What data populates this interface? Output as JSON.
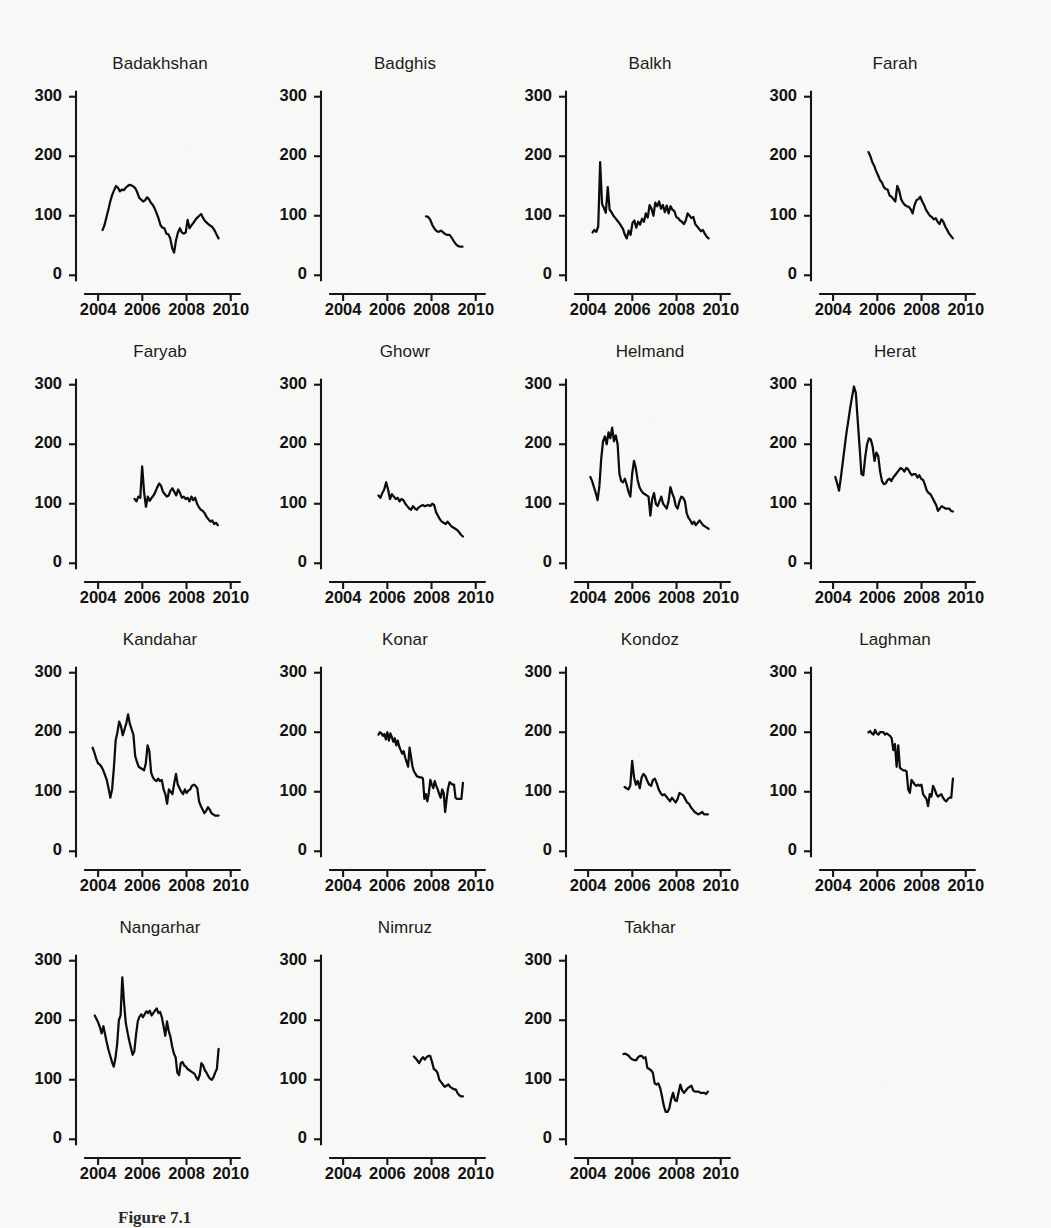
{
  "figure": {
    "caption": "Figure 7.1",
    "background_color": "#f8f8f6",
    "line_color": "#0c0c0c",
    "axis_color": "#151515",
    "columns": 4,
    "rows": 4
  },
  "chart_data": {
    "type": "line",
    "title": "",
    "subtitle": "",
    "xlabel": "",
    "ylabel": "",
    "xlim": [
      2003.0,
      2010.6
    ],
    "ylim": [
      -18,
      318
    ],
    "grid": false,
    "legend": "none",
    "panel_layout": "4 columns x 4 rows of small-multiple line panels; last row has 3 panels",
    "shared_x_ticks": [
      2004,
      2006,
      2008,
      2010
    ],
    "shared_x_tick_labels": [
      "2004",
      "2006",
      "2008",
      "2010"
    ],
    "shared_y_ticks": [
      0,
      100,
      200,
      300
    ],
    "shared_y_tick_labels": [
      "0",
      "100",
      "200",
      "300"
    ],
    "panels": [
      {
        "title": "Badakhshan",
        "x_start": 2004.2,
        "x_end": 2009.45,
        "values": [
          76,
          84,
          97,
          110,
          124,
          135,
          143,
          150,
          147,
          141,
          144,
          143,
          147,
          150,
          152,
          151,
          149,
          146,
          139,
          130,
          127,
          124,
          126,
          131,
          128,
          122,
          118,
          112,
          104,
          95,
          84,
          80,
          79,
          70,
          69,
          62,
          46,
          38,
          59,
          72,
          79,
          72,
          70,
          72,
          93,
          79,
          84,
          88,
          93,
          97,
          100,
          103,
          96,
          91,
          88,
          85,
          83,
          80,
          75,
          68,
          62
        ]
      },
      {
        "title": "Badghis",
        "x_start": 2007.75,
        "x_end": 2009.4,
        "values": [
          99,
          98,
          93,
          84,
          78,
          74,
          73,
          75,
          72,
          69,
          68,
          68,
          63,
          57,
          52,
          49,
          48,
          48
        ]
      },
      {
        "title": "Balkh",
        "x_start": 2004.2,
        "x_end": 2009.45,
        "values": [
          72,
          76,
          73,
          82,
          190,
          120,
          113,
          105,
          148,
          110,
          106,
          100,
          96,
          92,
          88,
          83,
          78,
          68,
          62,
          75,
          68,
          88,
          92,
          80,
          90,
          85,
          95,
          90,
          104,
          97,
          118,
          112,
          100,
          122,
          116,
          124,
          112,
          118,
          106,
          117,
          104,
          116,
          110,
          108,
          98,
          96,
          92,
          90,
          86,
          92,
          104,
          100,
          96,
          98,
          86,
          82,
          78,
          74,
          76,
          70,
          65,
          62
        ]
      },
      {
        "title": "Farah",
        "x_start": 2005.6,
        "x_end": 2009.42,
        "values": [
          207,
          200,
          190,
          184,
          175,
          168,
          160,
          156,
          148,
          145,
          144,
          134,
          132,
          128,
          124,
          150,
          142,
          128,
          122,
          118,
          116,
          115,
          111,
          104,
          118,
          126,
          128,
          132,
          124,
          118,
          110,
          105,
          100,
          98,
          94,
          96,
          90,
          86,
          94,
          90,
          82,
          76,
          70,
          66,
          62
        ]
      },
      {
        "title": "Faryab",
        "x_start": 2005.65,
        "x_end": 2009.42,
        "values": [
          108,
          104,
          112,
          110,
          163,
          120,
          95,
          112,
          105,
          110,
          114,
          120,
          128,
          134,
          130,
          120,
          116,
          112,
          114,
          122,
          126,
          120,
          114,
          124,
          118,
          110,
          112,
          108,
          110,
          104,
          112,
          106,
          110,
          100,
          94,
          90,
          88,
          84,
          78,
          74,
          70,
          72,
          66,
          68,
          64
        ]
      },
      {
        "title": "Ghowr",
        "x_start": 2005.6,
        "x_end": 2009.42,
        "values": [
          114,
          110,
          118,
          124,
          136,
          124,
          108,
          116,
          112,
          108,
          110,
          104,
          108,
          106,
          100,
          96,
          92,
          90,
          96,
          92,
          90,
          94,
          96,
          98,
          96,
          97,
          98,
          96,
          100,
          98,
          86,
          80,
          74,
          70,
          68,
          66,
          70,
          66,
          62,
          60,
          58,
          56,
          52,
          48,
          45
        ]
      },
      {
        "title": "Helmand",
        "x_start": 2004.1,
        "x_end": 2009.45,
        "values": [
          145,
          138,
          128,
          118,
          106,
          130,
          176,
          205,
          213,
          200,
          220,
          210,
          228,
          205,
          215,
          200,
          150,
          138,
          136,
          142,
          132,
          120,
          112,
          150,
          172,
          160,
          140,
          128,
          122,
          118,
          116,
          114,
          112,
          80,
          108,
          118,
          100,
          96,
          104,
          112,
          100,
          96,
          92,
          104,
          128,
          118,
          110,
          96,
          92,
          104,
          112,
          110,
          104,
          84,
          76,
          72,
          66,
          70,
          64,
          68,
          72,
          68,
          64,
          62,
          60,
          58
        ]
      },
      {
        "title": "Herat",
        "x_start": 2004.1,
        "x_end": 2009.42,
        "values": [
          145,
          134,
          122,
          145,
          170,
          195,
          220,
          240,
          262,
          280,
          297,
          286,
          240,
          196,
          150,
          148,
          178,
          200,
          210,
          208,
          196,
          172,
          186,
          180,
          154,
          138,
          133,
          134,
          140,
          142,
          138,
          144,
          148,
          152,
          156,
          160,
          158,
          154,
          160,
          158,
          152,
          148,
          150,
          150,
          144,
          148,
          142,
          140,
          132,
          122,
          118,
          116,
          110,
          104,
          98,
          88,
          92,
          96,
          94,
          92,
          92,
          92,
          88,
          87
        ]
      },
      {
        "title": "Kandahar",
        "x_start": 2003.75,
        "x_end": 2009.45,
        "values": [
          174,
          166,
          156,
          148,
          146,
          142,
          136,
          128,
          120,
          106,
          90,
          104,
          140,
          186,
          200,
          218,
          210,
          195,
          205,
          215,
          230,
          214,
          205,
          196,
          160,
          150,
          142,
          140,
          138,
          136,
          148,
          178,
          168,
          132,
          124,
          120,
          118,
          122,
          118,
          120,
          104,
          96,
          80,
          104,
          100,
          96,
          114,
          130,
          112,
          106,
          100,
          96,
          104,
          98,
          102,
          104,
          110,
          112,
          110,
          106,
          84,
          76,
          70,
          64,
          68,
          74,
          70,
          64,
          62,
          60,
          60,
          60
        ]
      },
      {
        "title": "Konar",
        "x_start": 2005.6,
        "x_end": 2009.42,
        "values": [
          196,
          200,
          198,
          194,
          197,
          188,
          200,
          186,
          198,
          192,
          184,
          190,
          178,
          186,
          176,
          170,
          164,
          168,
          158,
          150,
          142,
          174,
          158,
          142,
          134,
          130,
          126,
          125,
          124,
          124,
          122,
          88,
          96,
          84,
          98,
          120,
          112,
          106,
          118,
          110,
          104,
          96,
          90,
          104,
          98,
          66,
          88,
          106,
          116,
          114,
          112,
          112,
          90,
          88,
          88,
          88,
          88,
          115
        ]
      },
      {
        "title": "Kondoz",
        "x_start": 2005.65,
        "x_end": 2009.42,
        "values": [
          108,
          106,
          104,
          110,
          152,
          124,
          112,
          118,
          106,
          124,
          130,
          126,
          118,
          112,
          110,
          120,
          122,
          114,
          104,
          98,
          94,
          96,
          92,
          88,
          84,
          90,
          86,
          82,
          88,
          98,
          96,
          94,
          88,
          82,
          80,
          74,
          70,
          66,
          64,
          62,
          64,
          66,
          62,
          62,
          62
        ]
      },
      {
        "title": "Laghman",
        "x_start": 2005.6,
        "x_end": 2009.42,
        "values": [
          200,
          202,
          198,
          196,
          204,
          198,
          196,
          200,
          200,
          200,
          196,
          198,
          196,
          194,
          190,
          170,
          180,
          142,
          178,
          140,
          138,
          136,
          136,
          134,
          104,
          98,
          120,
          116,
          112,
          110,
          112,
          110,
          112,
          96,
          92,
          88,
          76,
          96,
          92,
          110,
          104,
          96,
          92,
          94,
          96,
          90,
          86,
          84,
          88,
          90,
          90,
          122
        ]
      },
      {
        "title": "Nangarhar",
        "x_start": 2003.85,
        "x_end": 2009.45,
        "values": [
          208,
          202,
          196,
          188,
          178,
          190,
          176,
          162,
          150,
          140,
          130,
          122,
          136,
          160,
          200,
          208,
          272,
          230,
          196,
          180,
          166,
          154,
          142,
          148,
          176,
          198,
          206,
          210,
          205,
          210,
          215,
          212,
          216,
          208,
          212,
          216,
          220,
          212,
          214,
          205,
          190,
          174,
          198,
          182,
          172,
          156,
          144,
          138,
          112,
          108,
          128,
          130,
          124,
          122,
          118,
          116,
          114,
          112,
          110,
          104,
          100,
          108,
          128,
          124,
          116,
          112,
          106,
          102,
          100,
          104,
          112,
          118,
          152
        ]
      },
      {
        "title": "Nimruz",
        "x_start": 2007.2,
        "x_end": 2009.42,
        "values": [
          139,
          136,
          132,
          128,
          134,
          138,
          134,
          138,
          140,
          140,
          130,
          118,
          116,
          112,
          100,
          96,
          92,
          88,
          90,
          92,
          88,
          86,
          84,
          84,
          78,
          74,
          72,
          72
        ]
      },
      {
        "title": "Takhar",
        "x_start": 2005.6,
        "x_end": 2009.42,
        "values": [
          143,
          144,
          142,
          140,
          136,
          134,
          133,
          133,
          138,
          140,
          140,
          136,
          138,
          120,
          118,
          116,
          112,
          94,
          92,
          94,
          86,
          72,
          56,
          46,
          46,
          52,
          68,
          78,
          66,
          64,
          78,
          92,
          82,
          78,
          82,
          86,
          88,
          90,
          82,
          80,
          80,
          80,
          78,
          78,
          78,
          76,
          80
        ]
      }
    ]
  }
}
